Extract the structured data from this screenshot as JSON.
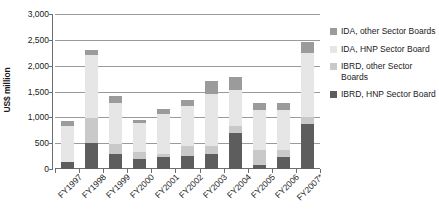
{
  "chart_data": {
    "type": "bar",
    "barmode": "stacked",
    "title": "",
    "xlabel": "",
    "ylabel": "US$ million",
    "ylim": [
      0,
      3000
    ],
    "ytick_step": 500,
    "ytick_labels": [
      "0",
      "500",
      "1,000",
      "1,500",
      "2,000",
      "2,500",
      "3,000"
    ],
    "ytick_values": [
      0,
      500,
      1000,
      1500,
      2000,
      2500,
      3000
    ],
    "grid": "horizontal",
    "legend_position": "right",
    "categories": [
      "FY1997",
      "FY1998",
      "FY1999",
      "FY2000",
      "FY2001",
      "FY2002",
      "FY2003",
      "FY2004",
      "FY2005",
      "FY2006",
      "FY2007*"
    ],
    "series": [
      {
        "name": "IBRD, HNP Sector Board",
        "color": "#5d5d5d",
        "values": [
          130,
          500,
          300,
          190,
          240,
          250,
          300,
          700,
          70,
          230,
          880
        ]
      },
      {
        "name": "IBRD, other Sector Boards",
        "color": "#c9c9c9",
        "values": [
          0,
          480,
          180,
          140,
          60,
          190,
          150,
          140,
          300,
          130,
          130
        ]
      },
      {
        "name": "IDA, HNP Sector Board",
        "color": "#e6e6e6",
        "values": [
          700,
          1230,
          790,
          570,
          760,
          780,
          1010,
          690,
          780,
          790,
          1230
        ]
      },
      {
        "name": "IDA, other Sector Boards",
        "color": "#9b9b9b",
        "values": [
          100,
          90,
          150,
          50,
          100,
          120,
          240,
          260,
          120,
          120,
          210
        ]
      }
    ],
    "totals": [
      930,
      2300,
      1420,
      950,
      1160,
      1340,
      1700,
      1790,
      1270,
      1270,
      2450
    ]
  },
  "legend": {
    "items": [
      {
        "label": "IDA, other Sector Boards",
        "color": "#9b9b9b",
        "swatch_name": "legend-swatch-ida-other"
      },
      {
        "label": "IDA, HNP Sector Board",
        "color": "#e6e6e6",
        "swatch_name": "legend-swatch-ida-hnp"
      },
      {
        "label": "IBRD, other Sector Boards",
        "color": "#c9c9c9",
        "swatch_name": "legend-swatch-ibrd-other"
      },
      {
        "label": "IBRD, HNP Sector Board",
        "color": "#5d5d5d",
        "swatch_name": "legend-swatch-ibrd-hnp"
      }
    ]
  },
  "colors": {
    "gridline": "#9b9b9b",
    "axis": "#6e6e6e",
    "text": "#1a1a1a",
    "background": "#ffffff"
  }
}
